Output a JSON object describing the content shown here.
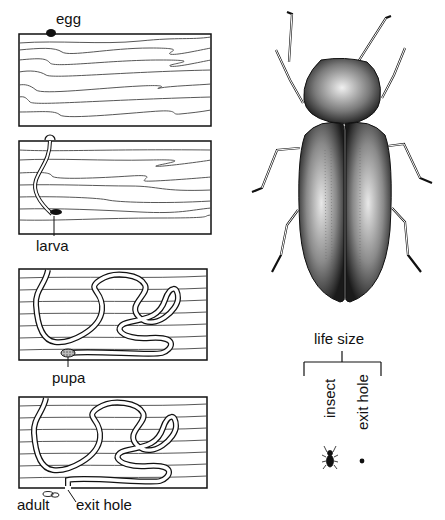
{
  "diagram": {
    "stages": [
      {
        "id": "egg",
        "label": "egg"
      },
      {
        "id": "larva",
        "label": "larva"
      },
      {
        "id": "pupa",
        "label": "pupa"
      },
      {
        "id": "adult",
        "label": "adult",
        "secondary_label": "exit hole"
      }
    ],
    "life_size": {
      "heading": "life size",
      "items": [
        {
          "label": "insect"
        },
        {
          "label": "exit hole"
        }
      ]
    },
    "colors": {
      "ink": "#111111",
      "grain": "#444444",
      "background": "#ffffff"
    }
  }
}
